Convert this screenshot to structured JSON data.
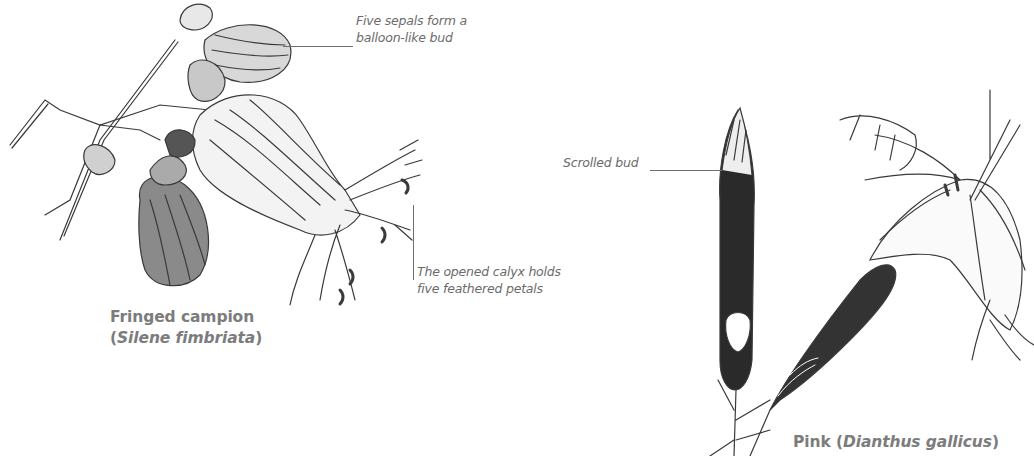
{
  "figure": {
    "left_specimen": {
      "common_name": "Fringed campion",
      "paren_open": "(",
      "scientific_name": "Silene fimbriata",
      "paren_close": ")",
      "annotations": [
        {
          "line1": "Five sepals form a",
          "line2": "balloon-like bud"
        },
        {
          "line1": "The opened calyx holds",
          "line2": "five feathered petals"
        }
      ]
    },
    "right_specimen": {
      "common_name": "Pink",
      "paren_open": " (",
      "scientific_name": "Dianthus gallicus",
      "paren_close": ")",
      "annotations": [
        {
          "line1": "Scrolled bud"
        }
      ]
    }
  },
  "colors": {
    "background": "#ffffff",
    "caption_text": "#7c7c7c",
    "annotation_text": "#6b6b6b",
    "sketch_stroke": "#3a3a3a"
  }
}
